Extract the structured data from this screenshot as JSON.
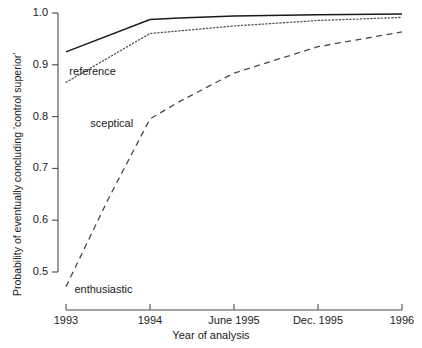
{
  "chart_data": {
    "type": "line",
    "title": "",
    "xlabel": "Year of analysis",
    "ylabel": "Probability of eventually concluding 'control superior'",
    "x_tick_labels": [
      "1993",
      "1994",
      "June 1995",
      "Dec. 1995",
      "1996"
    ],
    "x_tick_values": [
      0,
      1,
      2,
      3,
      4
    ],
    "xlim": [
      0,
      4
    ],
    "y_tick_labels": [
      "0.5",
      "0.6",
      "0.7",
      "0.8",
      "0.9",
      "1.0"
    ],
    "y_tick_values": [
      0.5,
      0.6,
      0.7,
      0.8,
      0.9,
      1.0
    ],
    "ylim": [
      0.46,
      1.005
    ],
    "grid": false,
    "legend": "inline-annotations",
    "series": [
      {
        "name": "reference",
        "style": "solid",
        "color": "#1a1a1a",
        "label_x": 0.04,
        "label_y": 0.887,
        "x": [
          0,
          1,
          1.35,
          2,
          3,
          4
        ],
        "values": [
          0.925,
          0.9875,
          0.9905,
          0.994,
          0.9965,
          0.998
        ]
      },
      {
        "name": "sceptical",
        "style": "dotted",
        "color": "#555555",
        "label_x": 0.29,
        "label_y": 0.785,
        "x": [
          0,
          1,
          1.35,
          2,
          3,
          4
        ],
        "values": [
          0.866,
          0.9605,
          0.9655,
          0.975,
          0.9855,
          0.9915
        ]
      },
      {
        "name": "enthusiastic",
        "style": "dashed",
        "color": "#4a4a4a",
        "label_x": 0.1,
        "label_y": 0.465,
        "x": [
          0,
          0.5,
          1,
          1.35,
          2,
          3,
          4
        ],
        "values": [
          0.4715,
          0.64,
          0.7955,
          0.829,
          0.884,
          0.935,
          0.9635
        ]
      }
    ]
  },
  "axis": {
    "y_ticks": [
      {
        "label": "1.0",
        "value": 1.0
      },
      {
        "label": "0.9",
        "value": 0.9
      },
      {
        "label": "0.8",
        "value": 0.8
      },
      {
        "label": "0.7",
        "value": 0.7
      },
      {
        "label": "0.6",
        "value": 0.6
      },
      {
        "label": "0.5",
        "value": 0.5
      }
    ],
    "x_ticks": [
      {
        "label": "1993",
        "value": 0
      },
      {
        "label": "1994",
        "value": 1
      },
      {
        "label": "June 1995",
        "value": 2
      },
      {
        "label": "Dec. 1995",
        "value": 3
      },
      {
        "label": "1996",
        "value": 4
      }
    ],
    "x_title": "Year of analysis",
    "y_title": "Probability of eventually concluding 'control superior'",
    "axis_color": "#4d4d4d"
  }
}
